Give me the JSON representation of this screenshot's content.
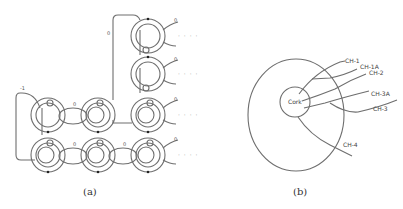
{
  "figure": {
    "panel_a": {
      "caption": "(a)",
      "framing_labels": {
        "top_loop": "0",
        "left_loop": "-1",
        "row_links": [
          "0",
          "0",
          "0"
        ],
        "right_strands": [
          "0",
          "0",
          "0",
          "0"
        ]
      },
      "continuation": "· · · ·"
    },
    "panel_b": {
      "caption": "(b)",
      "center_label": "Cork",
      "channels": [
        "CH-1",
        "CH-1A",
        "CH-2",
        "CH-3A",
        "CH-3",
        "CH-4"
      ]
    }
  }
}
